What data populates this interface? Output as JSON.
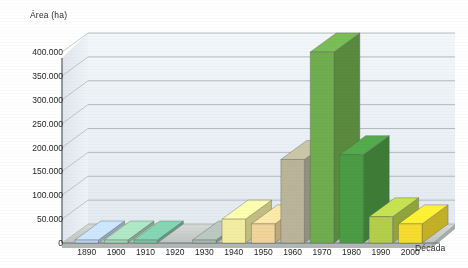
{
  "chart_data": {
    "type": "bar",
    "title": "",
    "subtitle": "",
    "xlabel": "Década",
    "ylabel": "Área (ha)",
    "categories": [
      "1890",
      "1900",
      "1910",
      "1920",
      "1930",
      "1940",
      "1950",
      "1960",
      "1970",
      "1980",
      "1990",
      "2000"
    ],
    "values": [
      0,
      0,
      0,
      null,
      0,
      50000,
      40000,
      175000,
      400000,
      185000,
      55000,
      40000
    ],
    "bar_colors": [
      "#b9d2ef",
      "#9fd4b4",
      "#79c3a4",
      null,
      "#a9b7b0",
      "#f2eda0",
      "#f0d49a",
      "#b9b49a",
      "#6fad4e",
      "#4c9b45",
      "#b5ce4a",
      "#f5dc2f"
    ],
    "ylim": [
      0,
      400000
    ],
    "ytick_labels": [
      "0",
      "50.000",
      "100.000",
      "150.000",
      "200.000",
      "250.000",
      "300.000",
      "350.000",
      "400.000"
    ],
    "ytick_values": [
      0,
      50000,
      100000,
      150000,
      200000,
      250000,
      300000,
      350000,
      400000
    ],
    "grid": true,
    "legend": "none",
    "style": "3d-column"
  },
  "palette": {
    "plot_background": "#eef3f7",
    "floor": "#c8ccca",
    "gridline": "#9aa3a8",
    "axis_line": "#6b7379",
    "text": "#1f1f1f"
  }
}
